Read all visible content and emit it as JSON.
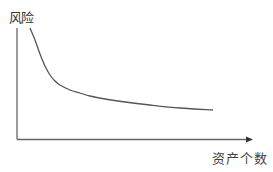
{
  "chart_data": {
    "type": "line",
    "title": "",
    "xlabel": "资产个数",
    "ylabel": "风险",
    "grid": false,
    "legend": null,
    "ticks": {
      "x": [],
      "y": []
    },
    "series": [
      {
        "name": "风险曲线",
        "description": "Risk decreases as number of assets increases, flattening toward a floor",
        "points_px": [
          [
            30,
            28
          ],
          [
            35,
            40
          ],
          [
            40,
            54
          ],
          [
            45,
            66
          ],
          [
            50,
            75
          ],
          [
            55,
            81
          ],
          [
            60,
            85
          ],
          [
            70,
            90
          ],
          [
            80,
            93
          ],
          [
            90,
            96
          ],
          [
            105,
            99
          ],
          [
            125,
            102
          ],
          [
            150,
            105
          ],
          [
            180,
            108
          ],
          [
            213,
            110
          ]
        ]
      }
    ],
    "colors": {
      "line": "#555555",
      "axis": "#555555",
      "text": "#333333"
    }
  },
  "labels": {
    "y_axis": "风险",
    "x_axis": "资产个数"
  }
}
